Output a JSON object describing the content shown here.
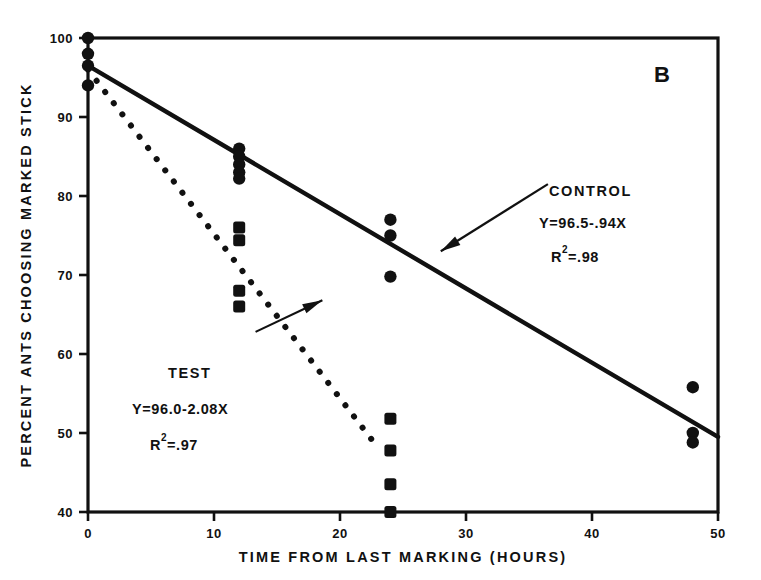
{
  "panel": {
    "label": "B"
  },
  "chart_data": {
    "type": "scatter",
    "title": "",
    "subtitle": "",
    "panel_label": "B",
    "xlabel": "TIME FROM LAST MARKING (HOURS)",
    "ylabel": "PERCENT ANTS CHOOSING MARKED STICK",
    "xlim": [
      0,
      50
    ],
    "ylim": [
      40,
      100
    ],
    "xticks": [
      0,
      10,
      20,
      30,
      40,
      50
    ],
    "xtick_labels": [
      "0",
      "10",
      "20",
      "30",
      "40",
      "50"
    ],
    "yticks": [
      40,
      50,
      60,
      70,
      80,
      90,
      100
    ],
    "ytick_labels": [
      "40",
      "50",
      "60",
      "70",
      "80",
      "90",
      "100"
    ],
    "grid": false,
    "legend_position": "in-plot-annotations",
    "frame": "box",
    "series": [
      {
        "name": "CONTROL",
        "marker": "filled-circle",
        "line_style": "solid",
        "equation": "Y=96.5-.94X",
        "r_squared_label": "R",
        "r_squared_exponent": "2",
        "r_squared_value": "=.98",
        "fit_slope": -0.94,
        "fit_intercept": 96.5,
        "fit_x_range": [
          0,
          50
        ],
        "points": [
          {
            "x": 0,
            "y": 100
          },
          {
            "x": 0,
            "y": 98
          },
          {
            "x": 0,
            "y": 96.5
          },
          {
            "x": 0,
            "y": 94
          },
          {
            "x": 12,
            "y": 86
          },
          {
            "x": 12,
            "y": 85
          },
          {
            "x": 12,
            "y": 84
          },
          {
            "x": 12,
            "y": 83
          },
          {
            "x": 12,
            "y": 82.2
          },
          {
            "x": 24,
            "y": 77
          },
          {
            "x": 24,
            "y": 75
          },
          {
            "x": 24,
            "y": 69.8
          },
          {
            "x": 48,
            "y": 55.8
          },
          {
            "x": 48,
            "y": 50
          },
          {
            "x": 48,
            "y": 48.8
          }
        ]
      },
      {
        "name": "TEST",
        "marker": "filled-square",
        "line_style": "dotted",
        "equation": "Y=96.0-2.08X",
        "r_squared_label": "R",
        "r_squared_exponent": "2",
        "r_squared_value": "=.97",
        "fit_slope": -2.08,
        "fit_intercept": 96.0,
        "fit_x_range": [
          0,
          22.5
        ],
        "points": [
          {
            "x": 12,
            "y": 76
          },
          {
            "x": 12,
            "y": 74.4
          },
          {
            "x": 12,
            "y": 68
          },
          {
            "x": 12,
            "y": 66
          },
          {
            "x": 24,
            "y": 51.8
          },
          {
            "x": 24,
            "y": 47.8
          },
          {
            "x": 24,
            "y": 43.5
          },
          {
            "x": 24,
            "y": 40
          }
        ]
      }
    ],
    "annotations": [
      {
        "name": "CONTROL",
        "line1": "CONTROL",
        "line2": "Y=96.5-.94X",
        "line3_base": "R",
        "line3_sup": "2",
        "line3_rest": "=.98",
        "pointer_from": {
          "x": 36.5,
          "y": 81.5
        },
        "pointer_to": {
          "x": 28.0,
          "y": 73.0
        }
      },
      {
        "name": "TEST",
        "line1": "TEST",
        "line2": "Y=96.0-2.08X",
        "line3_base": "R",
        "line3_sup": "2",
        "line3_rest": "=.97",
        "pointer_from": {
          "x": 13.3,
          "y": 62.8
        },
        "pointer_to": {
          "x": 18.6,
          "y": 66.8
        }
      }
    ]
  }
}
